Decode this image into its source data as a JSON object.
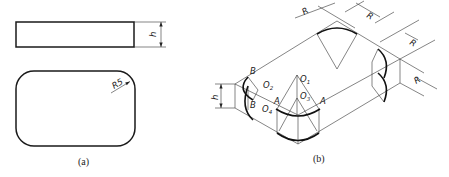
{
  "figure": {
    "panel_a": {
      "caption": "(a)",
      "front_view": {
        "dimension_label": "h"
      },
      "top_view": {
        "radius_label": "R5"
      }
    },
    "panel_b": {
      "caption": "(b)",
      "height_label": "h",
      "radius_labels": [
        "R",
        "R",
        "R",
        "R"
      ],
      "point_labels": {
        "B_top": "B",
        "B_bottom": "B",
        "A_left": "A",
        "A_right": "A",
        "O1": "O",
        "O1_sub": "1",
        "O2": "O",
        "O2_sub": "2",
        "O3": "O",
        "O3_sub": "3",
        "O4": "O",
        "O4_sub": "4"
      }
    }
  },
  "colors": {
    "line": "#1a1a1a",
    "background": "#ffffff"
  }
}
